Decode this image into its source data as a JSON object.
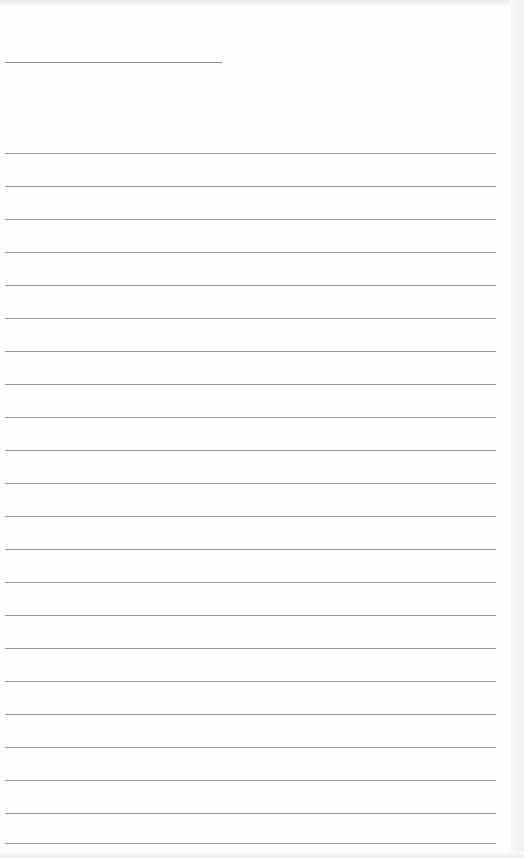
{
  "page": {
    "type": "blank lined paper",
    "background_color": "#fefefe",
    "line_color": "#9a9a9a",
    "header_line": {
      "y": 62,
      "x_start": 5,
      "x_end": 222
    },
    "rules": {
      "x_start": 5,
      "x_end": 496,
      "y_positions": [
        153,
        186,
        219,
        252,
        285,
        318,
        351,
        384,
        417,
        450,
        483,
        516,
        549,
        582,
        615,
        648,
        681,
        714,
        747,
        780,
        813,
        843
      ]
    }
  }
}
